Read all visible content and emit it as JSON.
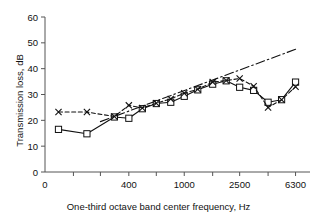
{
  "chart_data": {
    "type": "line",
    "title": "",
    "subtitle": "",
    "xlabel": "One-third octave band center frequency, Hz",
    "ylabel": "Transmission loss, dB",
    "xscale": "log",
    "x_tick_labels": [
      "0",
      "400",
      "1000",
      "2500",
      "6300"
    ],
    "x_tick_values": [
      0,
      400,
      1000,
      2500,
      6300
    ],
    "x_minor_ticks": [
      160,
      250,
      400,
      630,
      1000,
      1600,
      2500,
      4000,
      6300
    ],
    "y_tick_labels": [
      "0",
      "10",
      "20",
      "30",
      "40",
      "50",
      "60"
    ],
    "y_tick_values": [
      0,
      10,
      20,
      30,
      40,
      50,
      60
    ],
    "ylim": [
      0,
      60
    ],
    "xlim": [
      100,
      8000
    ],
    "grid": false,
    "legend": "none",
    "colors": {
      "line": "#111111",
      "background": "#ffffff",
      "axis": "#555555"
    },
    "x": [
      125,
      200,
      315,
      400,
      500,
      630,
      800,
      1000,
      1250,
      1600,
      2000,
      2500,
      3150,
      4000,
      5000,
      6300
    ],
    "series": [
      {
        "name": "measured-squares",
        "marker": "square-open",
        "linestyle": "solid",
        "values": [
          16.5,
          14.8,
          21.3,
          20.8,
          24.5,
          26.5,
          27.0,
          29.3,
          31.8,
          34.0,
          35.3,
          32.8,
          31.6,
          27.0,
          28.0,
          34.8
        ]
      },
      {
        "name": "predicted-crosses",
        "marker": "x",
        "linestyle": "dashed",
        "values": [
          23.2,
          23.2,
          21.5,
          25.8,
          24.8,
          26.6,
          28.3,
          30.5,
          32.0,
          34.8,
          35.4,
          36.2,
          33.2,
          25.0,
          28.0,
          33.0
        ]
      },
      {
        "name": "mass-law-dashdot",
        "marker": "none",
        "linestyle": "dashdot",
        "x": [
          250,
          6300
        ],
        "values": [
          19.5,
          47.5
        ]
      }
    ]
  }
}
